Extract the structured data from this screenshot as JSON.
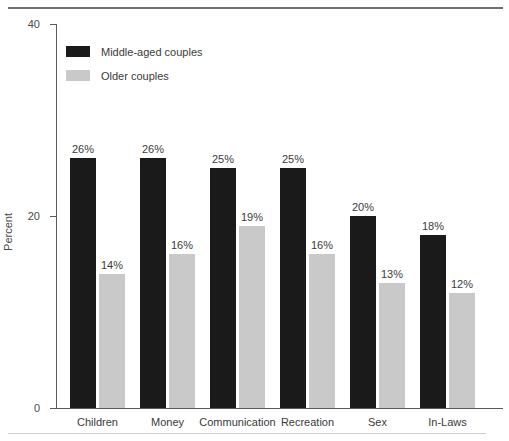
{
  "chart_data": {
    "type": "bar",
    "title": "",
    "xlabel": "",
    "ylabel": "Percent",
    "ylim": [
      0,
      40
    ],
    "yticks": [
      "0",
      "20",
      "40"
    ],
    "ytick_values": [
      0,
      20,
      40
    ],
    "grid": false,
    "legend_position": "top-left inside plot",
    "categories": [
      "Children",
      "Money",
      "Communication",
      "Recreation",
      "Sex",
      "In-Laws"
    ],
    "series": [
      {
        "name": "Middle-aged couples",
        "color": "#1a1a1a",
        "values": [
          26,
          26,
          25,
          25,
          20,
          18
        ],
        "data_labels": [
          "26%",
          "26%",
          "25%",
          "25%",
          "20%",
          "18%"
        ]
      },
      {
        "name": "Older couples",
        "color": "#c9c9c9",
        "values": [
          14,
          16,
          19,
          16,
          13,
          12
        ],
        "data_labels": [
          "14%",
          "16%",
          "19%",
          "16%",
          "13%",
          "12%"
        ]
      }
    ]
  }
}
